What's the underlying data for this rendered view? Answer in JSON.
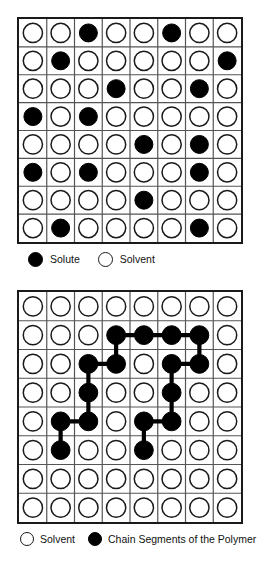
{
  "figure": {
    "grid_rows": 8,
    "grid_cols": 8,
    "colors": {
      "filled": "#000000",
      "open_outline": "#1a1a1a",
      "cell_border": "#555555",
      "frame": "#1a1a1a",
      "background": "#ffffff",
      "bond": "#000000"
    }
  },
  "panel_top": {
    "name": "solution-lattice",
    "caption": "Lattice model of a solution",
    "rows": 8,
    "cols": 8,
    "filled_cells": [
      [
        1,
        3
      ],
      [
        1,
        6
      ],
      [
        2,
        2
      ],
      [
        2,
        8
      ],
      [
        3,
        4
      ],
      [
        3,
        7
      ],
      [
        4,
        1
      ],
      [
        4,
        3
      ],
      [
        5,
        5
      ],
      [
        5,
        7
      ],
      [
        6,
        1
      ],
      [
        6,
        3
      ],
      [
        6,
        7
      ],
      [
        7,
        5
      ],
      [
        8,
        2
      ],
      [
        8,
        7
      ]
    ],
    "filled_count": 16,
    "open_count": 48,
    "legend": [
      {
        "marker": "filled-circle",
        "label": "Solute"
      },
      {
        "marker": "open-circle",
        "label": "Solvent"
      }
    ]
  },
  "panel_bottom": {
    "name": "polymer-solution-lattice",
    "caption": "Lattice model of a polymer solution",
    "rows": 8,
    "cols": 8,
    "filled_cells": [
      [
        2,
        4
      ],
      [
        2,
        5
      ],
      [
        2,
        6
      ],
      [
        2,
        7
      ],
      [
        3,
        3
      ],
      [
        3,
        4
      ],
      [
        3,
        6
      ],
      [
        3,
        7
      ],
      [
        4,
        3
      ],
      [
        4,
        6
      ],
      [
        5,
        2
      ],
      [
        5,
        3
      ],
      [
        5,
        5
      ],
      [
        5,
        6
      ],
      [
        6,
        2
      ],
      [
        6,
        5
      ]
    ],
    "filled_count": 16,
    "open_count": 48,
    "bonds": [
      {
        "from": [
          2,
          4
        ],
        "to": [
          2,
          5
        ],
        "orientation": "horizontal"
      },
      {
        "from": [
          2,
          5
        ],
        "to": [
          2,
          6
        ],
        "orientation": "horizontal"
      },
      {
        "from": [
          2,
          6
        ],
        "to": [
          2,
          7
        ],
        "orientation": "horizontal"
      },
      {
        "from": [
          2,
          4
        ],
        "to": [
          3,
          4
        ],
        "orientation": "vertical"
      },
      {
        "from": [
          3,
          3
        ],
        "to": [
          3,
          4
        ],
        "orientation": "horizontal"
      },
      {
        "from": [
          3,
          3
        ],
        "to": [
          4,
          3
        ],
        "orientation": "vertical"
      },
      {
        "from": [
          4,
          3
        ],
        "to": [
          5,
          3
        ],
        "orientation": "vertical"
      },
      {
        "from": [
          5,
          2
        ],
        "to": [
          5,
          3
        ],
        "orientation": "horizontal"
      },
      {
        "from": [
          5,
          2
        ],
        "to": [
          6,
          2
        ],
        "orientation": "vertical"
      },
      {
        "from": [
          2,
          7
        ],
        "to": [
          3,
          7
        ],
        "orientation": "vertical"
      },
      {
        "from": [
          3,
          6
        ],
        "to": [
          3,
          7
        ],
        "orientation": "horizontal"
      },
      {
        "from": [
          3,
          6
        ],
        "to": [
          4,
          6
        ],
        "orientation": "vertical"
      },
      {
        "from": [
          4,
          6
        ],
        "to": [
          5,
          6
        ],
        "orientation": "vertical"
      },
      {
        "from": [
          5,
          5
        ],
        "to": [
          5,
          6
        ],
        "orientation": "horizontal"
      },
      {
        "from": [
          5,
          5
        ],
        "to": [
          6,
          5
        ],
        "orientation": "vertical"
      }
    ],
    "legend": [
      {
        "marker": "open-circle",
        "label": "Solvent"
      },
      {
        "marker": "filled-circle",
        "label": "Chain Segments of the Polymer"
      }
    ]
  }
}
